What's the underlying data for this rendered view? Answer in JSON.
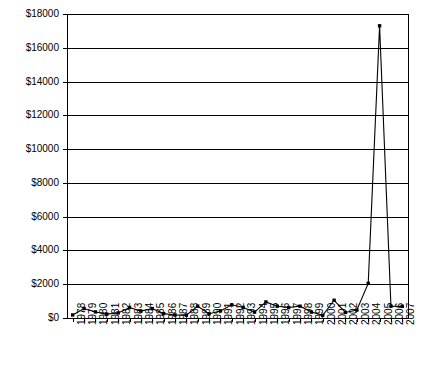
{
  "chart_data": {
    "type": "line",
    "title": "",
    "subtitle": "",
    "xlabel": "",
    "ylabel": "",
    "ylim": [
      0,
      18000
    ],
    "ytick_step": 2000,
    "grid": true,
    "legend": null,
    "marker": "square",
    "line_color": "#000000",
    "marker_color": "#000000",
    "grid_color": "#000000",
    "axis_color": "#000000",
    "background": "#ffffff",
    "ytick_labels": [
      "$18000",
      "$16000",
      "$14000",
      "$12000",
      "$10000",
      "$8000",
      "$6000",
      "$4000",
      "$2000",
      "$0"
    ],
    "ytick_values": [
      18000,
      16000,
      14000,
      12000,
      10000,
      8000,
      6000,
      4000,
      2000,
      0
    ],
    "categories": [
      "1978",
      "1979",
      "1980",
      "1981",
      "1982",
      "1983",
      "1984",
      "1985",
      "1986",
      "1987",
      "1988",
      "1989",
      "1990",
      "1991",
      "1992",
      "1993",
      "1994",
      "1995",
      "1996",
      "1997",
      "1998",
      "1999",
      "2000",
      "2001",
      "2002",
      "2003",
      "2004",
      "2005",
      "2006",
      "2007"
    ],
    "values": [
      180,
      560,
      360,
      230,
      300,
      620,
      410,
      560,
      260,
      180,
      170,
      700,
      250,
      420,
      780,
      620,
      350,
      950,
      700,
      620,
      700,
      350,
      160,
      1050,
      330,
      470,
      2050,
      17300,
      700,
      690
    ]
  }
}
